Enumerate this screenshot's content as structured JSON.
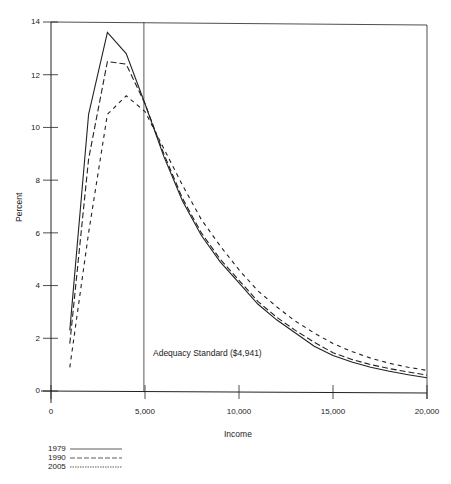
{
  "chart_data": {
    "type": "line",
    "title": "",
    "xlabel": "Income",
    "ylabel": "Percent",
    "xlim": [
      0,
      20000
    ],
    "ylim": [
      0,
      14
    ],
    "x_ticks": [
      "0",
      "5,000",
      "10,000",
      "15,000",
      "20,000"
    ],
    "y_ticks": [
      "0",
      "2",
      "4",
      "6",
      "8",
      "10",
      "12",
      "14"
    ],
    "grid": false,
    "legend_position": "bottom-left",
    "x": [
      1000,
      2000,
      3000,
      4000,
      5000,
      6000,
      7000,
      8000,
      9000,
      10000,
      11000,
      12000,
      13000,
      14000,
      15000,
      16000,
      17000,
      18000,
      19000,
      20000
    ],
    "series": [
      {
        "name": "1979",
        "style": "solid",
        "values": [
          2.3,
          10.5,
          13.6,
          12.8,
          10.9,
          8.9,
          7.2,
          5.9,
          4.9,
          4.1,
          3.3,
          2.7,
          2.2,
          1.7,
          1.35,
          1.1,
          0.9,
          0.75,
          0.62,
          0.5
        ]
      },
      {
        "name": "1990",
        "style": "long-dash",
        "values": [
          1.8,
          8.8,
          12.5,
          12.4,
          10.9,
          9.0,
          7.3,
          6.0,
          5.0,
          4.2,
          3.4,
          2.8,
          2.3,
          1.85,
          1.45,
          1.2,
          1.0,
          0.85,
          0.72,
          0.6
        ]
      },
      {
        "name": "2005",
        "style": "short-dash",
        "values": [
          0.9,
          6.0,
          10.5,
          11.2,
          10.6,
          9.2,
          7.8,
          6.5,
          5.5,
          4.6,
          3.8,
          3.2,
          2.65,
          2.2,
          1.8,
          1.5,
          1.25,
          1.05,
          0.9,
          0.78
        ]
      }
    ],
    "annotations": [
      {
        "type": "vline",
        "x": 4941,
        "label": "Adequacy Standard ($4,941)"
      }
    ]
  },
  "labels": {
    "ylabel": "Percent",
    "xlabel": "Income",
    "annotation": "Adequacy Standard ($4,941)",
    "yticks": [
      "14",
      "12",
      "10",
      "8",
      "6",
      "4",
      "2",
      "0"
    ],
    "xticks": [
      "0",
      "5,000",
      "10,000",
      "15,000",
      "20,000"
    ],
    "legend": [
      "1979",
      "1990",
      "2005"
    ]
  }
}
